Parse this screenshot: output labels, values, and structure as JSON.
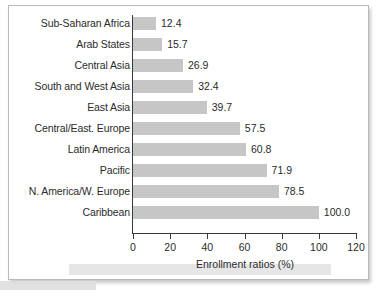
{
  "chart_data": {
    "type": "bar",
    "orientation": "horizontal",
    "title": "",
    "xlabel": "Enrollment ratios (%)",
    "ylabel": "",
    "xlim": [
      0,
      120
    ],
    "xticks": [
      0,
      20,
      40,
      60,
      80,
      100,
      120
    ],
    "grid": false,
    "legend": null,
    "bar_color": "#c6c6c6",
    "text_color": "#2b2b2b",
    "axis_color": "#3a3a3a",
    "categories": [
      "Sub-Saharan Africa",
      "Arab States",
      "Central Asia",
      "South and West Asia",
      "East Asia",
      "Central/East. Europe",
      "Latin America",
      "Pacific",
      "N. America/W. Europe",
      "Caribbean"
    ],
    "values": [
      12.4,
      15.7,
      26.9,
      32.4,
      39.7,
      57.5,
      60.8,
      71.9,
      78.5,
      100.0
    ],
    "value_labels": [
      "12.4",
      "15.7",
      "26.9",
      "32.4",
      "39.7",
      "57.5",
      "60.8",
      "71.9",
      "78.5",
      "100.0"
    ],
    "tick_labels": [
      "0",
      "20",
      "40",
      "60",
      "80",
      "100",
      "120"
    ]
  }
}
